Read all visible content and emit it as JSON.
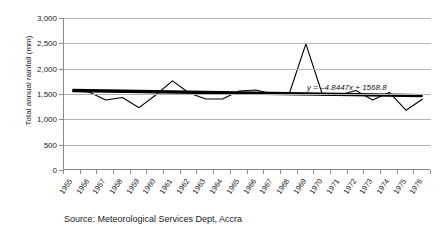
{
  "chart_data": {
    "type": "line",
    "title": "",
    "xlabel": "",
    "ylabel": "Total annual rainfall (mm)",
    "ylim": [
      0,
      3000
    ],
    "ytick_labels": [
      "3,000",
      "2,500",
      "2,000",
      "1,500",
      "1,000",
      "500",
      "0"
    ],
    "ytick_values": [
      3000,
      2500,
      2000,
      1500,
      1000,
      500,
      0
    ],
    "grid": true,
    "legend": "none",
    "categories": [
      "1955",
      "1956",
      "1957",
      "1958",
      "1959",
      "1960",
      "1961",
      "1962",
      "1963",
      "1964",
      "1965",
      "1966",
      "1967",
      "1968",
      "1969",
      "1970",
      "1971",
      "1972",
      "1973",
      "1974",
      "1975",
      "1976"
    ],
    "series": [
      {
        "name": "Total annual rainfall",
        "values": [
          1560,
          1540,
          1380,
          1430,
          1230,
          1480,
          1760,
          1520,
          1400,
          1400,
          1560,
          1580,
          1500,
          1500,
          2490,
          1480,
          1480,
          1570,
          1380,
          1530,
          1180,
          1400
        ]
      }
    ],
    "trendline": {
      "equation": "y = –4.8447x + 1568.8",
      "slope": -4.8447,
      "intercept": 1568.8,
      "start_value": 1568.8,
      "end_value": 1467.0
    },
    "annotations": [
      "y = –4.8447x + 1568.8"
    ],
    "caption": "Source: Meteorological Services Dept, Accra"
  },
  "axis": {
    "y_title": "Total annual rainfall (mm)"
  },
  "footer": {
    "source": "Source: Meteorological Services Dept, Accra"
  }
}
